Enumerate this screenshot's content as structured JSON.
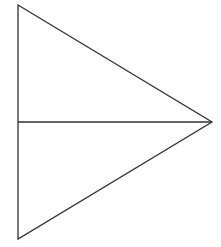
{
  "diagram": {
    "canvas": {
      "width": 221,
      "height": 247,
      "background": "#ffffff"
    },
    "stroke_color": "#333333",
    "stroke_width": 1.3,
    "triangle": {
      "vertices": {
        "top_left": [
          18,
          5
        ],
        "bottom_left": [
          18,
          239
        ],
        "apex": [
          212,
          122
        ]
      }
    },
    "median": {
      "from": [
        18,
        122
      ],
      "to": [
        212,
        122
      ]
    }
  }
}
